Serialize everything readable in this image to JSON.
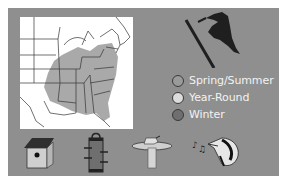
{
  "panel": {
    "background": "#8f8f8f"
  },
  "map": {
    "description": "Range map of eastern United States",
    "range_color": "#a9a9a9",
    "background": "#ffffff"
  },
  "bird": {
    "icon": "woodpecker-silhouette-icon"
  },
  "legend": {
    "items": [
      {
        "label": "Spring/Summer",
        "color": "#9a9a9a"
      },
      {
        "label": "Year-Round",
        "color": "#dcdcdc"
      },
      {
        "label": "Winter",
        "color": "#6f6f6f"
      }
    ]
  },
  "icons": [
    {
      "name": "birdhouse-icon"
    },
    {
      "name": "feeder-icon"
    },
    {
      "name": "birdbath-icon"
    },
    {
      "name": "bird-song-icon"
    }
  ]
}
